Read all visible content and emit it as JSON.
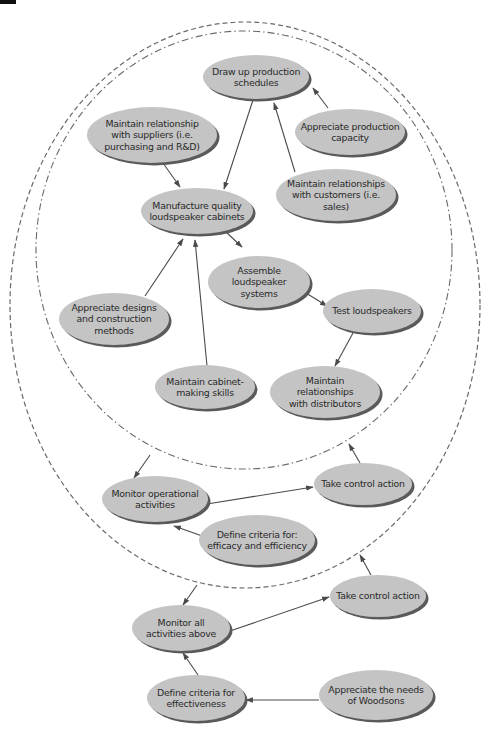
{
  "diagram": {
    "colors": {
      "node_fill": "#c4c4c4",
      "node_shadow": "#5a5a5a",
      "text": "#2a2a2a",
      "edge": "#4a4a4a",
      "boundary": "#6a6a6a",
      "background": "#ffffff"
    },
    "boundaries": [
      {
        "id": "operational-system",
        "style": "dash-dot",
        "cx": 244,
        "cy": 250,
        "rx": 208,
        "ry": 219
      },
      {
        "id": "monitoring-system",
        "style": "dashed",
        "cx": 245,
        "cy": 305,
        "rx": 235,
        "ry": 283
      }
    ],
    "nodes": [
      {
        "id": "n1",
        "lines": [
          "Draw up production",
          "schedules"
        ],
        "cx": 256,
        "cy": 77,
        "rx": 53,
        "ry": 22
      },
      {
        "id": "n2",
        "lines": [
          "Maintain relationship",
          "with suppliers (i.e.",
          "purchasing and R&D)"
        ],
        "cx": 152,
        "cy": 135,
        "rx": 65,
        "ry": 28
      },
      {
        "id": "n3",
        "lines": [
          "Appreciate production",
          "capacity"
        ],
        "cx": 350,
        "cy": 132,
        "rx": 55,
        "ry": 23
      },
      {
        "id": "n4",
        "lines": [
          "Maintain relationships",
          "with customers (i.e.",
          "sales)"
        ],
        "cx": 336,
        "cy": 195,
        "rx": 60,
        "ry": 26
      },
      {
        "id": "n5",
        "lines": [
          "Manufacture quality",
          "loudspeaker cabinets"
        ],
        "cx": 197,
        "cy": 211,
        "rx": 56,
        "ry": 23
      },
      {
        "id": "n6",
        "lines": [
          "Assemble",
          "loudspeaker",
          "systems"
        ],
        "cx": 259,
        "cy": 282,
        "rx": 51,
        "ry": 26
      },
      {
        "id": "n7",
        "lines": [
          "Appreciate designs",
          "and construction",
          "methods"
        ],
        "cx": 114,
        "cy": 319,
        "rx": 55,
        "ry": 26
      },
      {
        "id": "n8",
        "lines": [
          "Test loudspeakers"
        ],
        "cx": 372,
        "cy": 311,
        "rx": 49,
        "ry": 22
      },
      {
        "id": "n9",
        "lines": [
          "Maintain cabinet-",
          "making skills"
        ],
        "cx": 205,
        "cy": 387,
        "rx": 50,
        "ry": 22
      },
      {
        "id": "n10",
        "lines": [
          "Maintain",
          "relationships",
          "with distributors"
        ],
        "cx": 325,
        "cy": 392,
        "rx": 55,
        "ry": 26
      },
      {
        "id": "n11",
        "lines": [
          "Monitor operational",
          "activities"
        ],
        "cx": 155,
        "cy": 499,
        "rx": 53,
        "ry": 23
      },
      {
        "id": "n12",
        "lines": [
          "Take control action"
        ],
        "cx": 363,
        "cy": 484,
        "rx": 49,
        "ry": 21
      },
      {
        "id": "n13",
        "lines": [
          "Define criteria for:",
          "efficacy and efficiency"
        ],
        "cx": 257,
        "cy": 540,
        "rx": 58,
        "ry": 25
      },
      {
        "id": "n14",
        "lines": [
          "Take control action"
        ],
        "cx": 378,
        "cy": 596,
        "rx": 48,
        "ry": 21
      },
      {
        "id": "n15",
        "lines": [
          "Monitor all",
          "activities above"
        ],
        "cx": 181,
        "cy": 628,
        "rx": 49,
        "ry": 23
      },
      {
        "id": "n16",
        "lines": [
          "Define criteria for",
          "effectiveness"
        ],
        "cx": 196,
        "cy": 698,
        "rx": 49,
        "ry": 23
      },
      {
        "id": "n17",
        "lines": [
          "Appreciate the needs",
          "of Woodsons"
        ],
        "cx": 376,
        "cy": 695,
        "rx": 57,
        "ry": 25
      }
    ],
    "edges": [
      {
        "from": "n1",
        "to": "n5",
        "x1": 253,
        "y1": 100,
        "x2": 224,
        "y2": 189
      },
      {
        "from": "n2",
        "to": "n5",
        "x1": 163,
        "y1": 163,
        "x2": 180,
        "y2": 187
      },
      {
        "from": "n3",
        "to": "n1",
        "x1": 328,
        "y1": 108,
        "x2": 313,
        "y2": 88
      },
      {
        "from": "n4",
        "to": "n1",
        "x1": 295,
        "y1": 172,
        "x2": 274,
        "y2": 103
      },
      {
        "from": "n5",
        "to": "n6",
        "x1": 226,
        "y1": 232,
        "x2": 242,
        "y2": 247
      },
      {
        "from": "n7",
        "to": "n5",
        "x1": 145,
        "y1": 296,
        "x2": 183,
        "y2": 239
      },
      {
        "from": "n9",
        "to": "n5",
        "x1": 207,
        "y1": 366,
        "x2": 195,
        "y2": 240
      },
      {
        "from": "n6",
        "to": "n8",
        "x1": 306,
        "y1": 293,
        "x2": 327,
        "y2": 306
      },
      {
        "from": "n8",
        "to": "n10",
        "x1": 353,
        "y1": 333,
        "x2": 335,
        "y2": 366
      },
      {
        "from": "operational-system",
        "to": "n11",
        "x1": 150,
        "y1": 455,
        "x2": 134,
        "y2": 478
      },
      {
        "from": "n11",
        "to": "n12",
        "x1": 207,
        "y1": 504,
        "x2": 313,
        "y2": 487
      },
      {
        "from": "n12",
        "to": "operational-system",
        "x1": 360,
        "y1": 463,
        "x2": 349,
        "y2": 444
      },
      {
        "from": "n13",
        "to": "n11",
        "x1": 222,
        "y1": 543,
        "x2": 174,
        "y2": 526
      },
      {
        "from": "monitoring-system",
        "to": "n15",
        "x1": 197,
        "y1": 585,
        "x2": 183,
        "y2": 605
      },
      {
        "from": "n15",
        "to": "n14",
        "x1": 230,
        "y1": 631,
        "x2": 329,
        "y2": 597
      },
      {
        "from": "n14",
        "to": "monitoring-system",
        "x1": 371,
        "y1": 575,
        "x2": 360,
        "y2": 555
      },
      {
        "from": "n16",
        "to": "n15",
        "x1": 198,
        "y1": 675,
        "x2": 183,
        "y2": 653
      },
      {
        "from": "n17",
        "to": "n16",
        "x1": 319,
        "y1": 700,
        "x2": 246,
        "y2": 700
      }
    ]
  }
}
